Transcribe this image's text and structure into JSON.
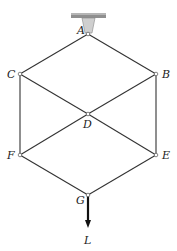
{
  "diagram": {
    "type": "truss",
    "colors": {
      "member": "#333333",
      "support": "#9a9a9a",
      "support_top": "#7d7d7d",
      "funnel": "#c8c8c8",
      "load": "#111111"
    },
    "nodes": [
      {
        "id": "A",
        "label": "A",
        "x": 88,
        "y": 34,
        "lx": 77,
        "ly": 34
      },
      {
        "id": "B",
        "label": "B",
        "x": 156,
        "y": 74,
        "lx": 162,
        "ly": 78
      },
      {
        "id": "C",
        "label": "C",
        "x": 20,
        "y": 74,
        "lx": 7,
        "ly": 78
      },
      {
        "id": "D",
        "label": "D",
        "x": 88,
        "y": 114,
        "lx": 83,
        "ly": 128
      },
      {
        "id": "E",
        "label": "E",
        "x": 156,
        "y": 155,
        "lx": 162,
        "ly": 159
      },
      {
        "id": "F",
        "label": "F",
        "x": 20,
        "y": 155,
        "lx": 7,
        "ly": 159
      },
      {
        "id": "G",
        "label": "G",
        "x": 88,
        "y": 195,
        "lx": 76,
        "ly": 204
      }
    ],
    "members": [
      [
        "A",
        "C"
      ],
      [
        "A",
        "B"
      ],
      [
        "C",
        "D"
      ],
      [
        "B",
        "D"
      ],
      [
        "C",
        "F"
      ],
      [
        "B",
        "E"
      ],
      [
        "D",
        "F"
      ],
      [
        "D",
        "E"
      ],
      [
        "F",
        "G"
      ],
      [
        "E",
        "G"
      ]
    ],
    "support": {
      "node": "A",
      "type": "pin-hanger"
    },
    "load": {
      "node": "G",
      "label": "L",
      "direction": "down",
      "end_y": 228,
      "label_x": 84,
      "label_y": 244
    }
  }
}
